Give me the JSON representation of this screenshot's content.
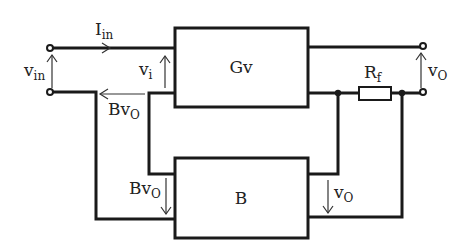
{
  "diagram": {
    "type": "feedback-amplifier-block-diagram",
    "blocks": {
      "forward": {
        "label": "Gv"
      },
      "feedback": {
        "label": "B"
      }
    },
    "labels": {
      "input_current": {
        "main": "I",
        "sub": "in"
      },
      "input_voltage": {
        "main": "v",
        "sub": "in"
      },
      "amp_input_voltage": {
        "main": "v",
        "sub": "i"
      },
      "feedback_voltage_top": {
        "main": "Bv",
        "sub": "O"
      },
      "feedback_voltage_bottom": {
        "main": "Bv",
        "sub": "O"
      },
      "output_voltage": {
        "main": "v",
        "sub": "O"
      },
      "feedback_input_voltage": {
        "main": "v",
        "sub": "O"
      },
      "resistor": {
        "main": "R",
        "sub": "f"
      }
    },
    "colors": {
      "line": "#1a1a1a",
      "background": "#ffffff"
    }
  }
}
